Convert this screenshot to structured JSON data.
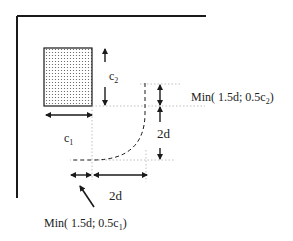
{
  "diagram": {
    "type": "punching-shear critical perimeter near slab corner",
    "labels": {
      "c1": "c",
      "c1_sub": "1",
      "c2": "c",
      "c2_sub": "2",
      "right_2d": "2d",
      "bottom_2d": "2d",
      "min_c2_prefix": "Min( 1.5d; 0.5c",
      "min_c2_sub": "2",
      "min_c2_suffix": ")",
      "min_c1_prefix": "Min( 1.5d; 0.5c",
      "min_c1_sub": "1",
      "min_c1_suffix": ")"
    },
    "colors": {
      "line": "#1a1a1a",
      "guide": "#b0b0b0",
      "fill_dots": "#555555",
      "background": "#ffffff"
    }
  }
}
